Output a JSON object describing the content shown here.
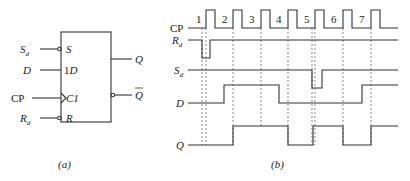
{
  "figure_a": {
    "caption": "(a)",
    "block": {
      "left": 61,
      "top": 32,
      "right": 111,
      "bottom": 122
    },
    "inputs": [
      {
        "name": "S",
        "sub": "d",
        "pin": "S",
        "y": 49,
        "inverted": true
      },
      {
        "name": "D",
        "sub": "",
        "pin": "1D",
        "y": 70,
        "inverted": false
      },
      {
        "name": "CP",
        "sub": "",
        "pin": "C1",
        "y": 98,
        "inverted": false,
        "clock": true
      },
      {
        "name": "R",
        "sub": "d",
        "pin": "R",
        "y": 118,
        "inverted": true
      }
    ],
    "outputs": [
      {
        "name": "Q",
        "y": 59,
        "inverted": false
      },
      {
        "name": "Q",
        "overbar": true,
        "y": 95,
        "inverted": true
      }
    ]
  },
  "figure_b": {
    "caption": "(b)",
    "signals": [
      {
        "name": "CP",
        "sub": "",
        "y_low": 28,
        "y_high": 10
      },
      {
        "name": "R",
        "sub": "d",
        "y_low": 58,
        "y_high": 40
      },
      {
        "name": "S",
        "sub": "d",
        "y_low": 88,
        "y_high": 70
      },
      {
        "name": "D",
        "sub": "",
        "y_low": 103,
        "y_high": 85
      },
      {
        "name": "Q",
        "sub": "",
        "y_low": 145,
        "y_high": 126
      }
    ],
    "clock_pulse_numbers": [
      "1",
      "2",
      "3",
      "4",
      "5",
      "6",
      "7"
    ],
    "clock_rising_edges_x": [
      206,
      233,
      261,
      288,
      315,
      343,
      371
    ],
    "waveforms": {
      "CP": "188,28 206,28 206,10 215,10 215,28 233,28 233,10 242,10 242,28 261,28 261,10 270,10 270,28 288,28 288,10 297,10 297,28 315,28 315,10 324,10 324,28 343,28 343,10 352,10 352,28 371,28 371,10 380,10 380,28 398,28",
      "Rd": "188,40 202,40 202,58 210,58 210,40 398,40",
      "Sd": "188,70 312,70 312,88 322,88 322,70 398,70",
      "D": "188,103 224,103 224,85 279,85 279,103 362,103 362,85 398,85",
      "Q": "188,145 233,145 233,126 288,126 288,145 313,145 313,126 343,126 343,145 371,145 371,126 398,126"
    },
    "dashed_lines_x": [
      202,
      206,
      233,
      261,
      288,
      312,
      315,
      343,
      371
    ],
    "dashed_range": {
      "y1": 28,
      "y2": 145
    }
  }
}
